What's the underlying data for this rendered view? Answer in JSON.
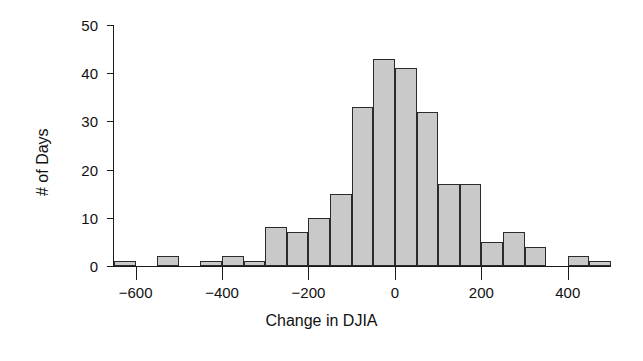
{
  "chart_data": {
    "type": "bar",
    "title": "",
    "subtitle": "",
    "xlabel": "Change in DJIA",
    "ylabel": "# of Days",
    "grid": false,
    "legend": null,
    "xlim": [
      -650,
      500
    ],
    "ylim": [
      0,
      50
    ],
    "xtick_values": [
      -600,
      -400,
      -200,
      0,
      200,
      400
    ],
    "xtick_labels": [
      "−600",
      "−400",
      "−200",
      "0",
      "200",
      "400"
    ],
    "ytick_values": [
      0,
      10,
      20,
      30,
      40,
      50
    ],
    "ytick_labels": [
      "0",
      "10",
      "20",
      "30",
      "40",
      "50"
    ],
    "bin_width": 50,
    "bin_starts": [
      -650,
      -550,
      -450,
      -400,
      -350,
      -300,
      -250,
      -200,
      -150,
      -100,
      -50,
      0,
      50,
      100,
      150,
      200,
      250,
      300,
      400,
      450
    ],
    "values": [
      1,
      2,
      1,
      2,
      1,
      8,
      7,
      10,
      15,
      33,
      43,
      41,
      32,
      17,
      17,
      5,
      7,
      4,
      2,
      1
    ],
    "bars": [
      {
        "bin_start": -650,
        "bin_end": -600,
        "value": 1
      },
      {
        "bin_start": -550,
        "bin_end": -500,
        "value": 2
      },
      {
        "bin_start": -450,
        "bin_end": -400,
        "value": 1
      },
      {
        "bin_start": -400,
        "bin_end": -350,
        "value": 2
      },
      {
        "bin_start": -350,
        "bin_end": -300,
        "value": 1
      },
      {
        "bin_start": -300,
        "bin_end": -250,
        "value": 8
      },
      {
        "bin_start": -250,
        "bin_end": -200,
        "value": 7
      },
      {
        "bin_start": -200,
        "bin_end": -150,
        "value": 10
      },
      {
        "bin_start": -150,
        "bin_end": -100,
        "value": 15
      },
      {
        "bin_start": -100,
        "bin_end": -50,
        "value": 33
      },
      {
        "bin_start": -50,
        "bin_end": 0,
        "value": 43
      },
      {
        "bin_start": 0,
        "bin_end": 50,
        "value": 41
      },
      {
        "bin_start": 50,
        "bin_end": 100,
        "value": 32
      },
      {
        "bin_start": 100,
        "bin_end": 150,
        "value": 17
      },
      {
        "bin_start": 150,
        "bin_end": 200,
        "value": 17
      },
      {
        "bin_start": 200,
        "bin_end": 250,
        "value": 5
      },
      {
        "bin_start": 250,
        "bin_end": 300,
        "value": 7
      },
      {
        "bin_start": 300,
        "bin_end": 350,
        "value": 4
      },
      {
        "bin_start": 400,
        "bin_end": 450,
        "value": 2
      },
      {
        "bin_start": 450,
        "bin_end": 500,
        "value": 1
      }
    ],
    "colors": {
      "bar_fill": "#c9c9c9",
      "bar_stroke": "#2b2b2b",
      "axis": "#1a1a1a",
      "background": "#ffffff",
      "text": "#111111"
    }
  }
}
